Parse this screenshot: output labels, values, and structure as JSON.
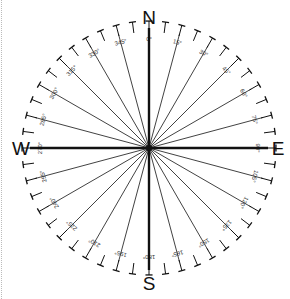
{
  "compass": {
    "cardinals": {
      "north": "N",
      "east": "E",
      "south": "S",
      "west": "W"
    },
    "degree_labels": [
      "0°",
      "15°",
      "30°",
      "45°",
      "60°",
      "75°",
      "90°",
      "105°",
      "120°",
      "135°",
      "150°",
      "165°",
      "180°",
      "195°",
      "210°",
      "225°",
      "240°",
      "255°",
      "270°",
      "285°",
      "300°",
      "315°",
      "330°",
      "345°"
    ],
    "label_step_degrees": 15,
    "tick_step_degrees": 7.5,
    "colors": {
      "line": "#111111",
      "text": "#333333",
      "background": "#ffffff"
    }
  }
}
